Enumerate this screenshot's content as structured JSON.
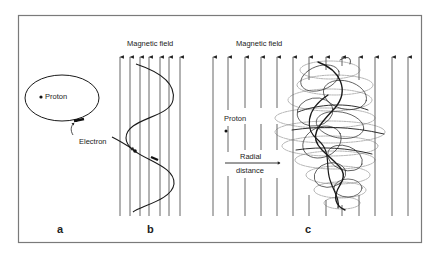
{
  "figure": {
    "colors": {
      "background": "#ffffff",
      "frame": "#7a7a7a",
      "field_line": "#555555",
      "trajectory": "#1a1a1a",
      "text": "#222222"
    },
    "panel_a": {
      "label": "a",
      "proton_label": "Proton",
      "electron_label": "Electron"
    },
    "panel_b": {
      "label": "b",
      "field_label": "Magnetic field",
      "field_line_count": 7
    },
    "panel_c": {
      "label": "c",
      "field_label": "Magnetic field",
      "proton_label": "Proton",
      "radial_label": "Radial",
      "distance_label": "distance",
      "field_line_count": 13
    }
  }
}
